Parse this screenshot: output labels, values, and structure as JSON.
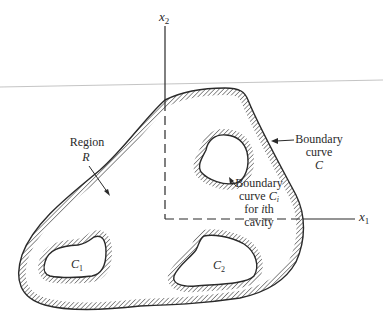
{
  "figure": {
    "axes": {
      "x1_label": "x",
      "x1_sub": "1",
      "x2_label": "x",
      "x2_sub": "2"
    },
    "labels": {
      "region_line1": "Region",
      "region_line2": "R",
      "boundary_c_line1": "Boundary",
      "boundary_c_line2": "curve",
      "boundary_c_line3": "C",
      "boundary_ci_line1": "Boundary",
      "boundary_ci_line2_prefix": "curve ",
      "boundary_ci_line2_var": "C",
      "boundary_ci_line2_sub": "i",
      "boundary_ci_line3_prefix": "for ",
      "boundary_ci_line3_var": "i",
      "boundary_ci_line3_suffix": "th",
      "boundary_ci_line4": "cavity",
      "cavity1_var": "C",
      "cavity1_sub": "1",
      "cavity2_var": "C",
      "cavity2_sub": "2"
    },
    "colors": {
      "ink": "#2a2a2a",
      "hatch": "#3a3a3a",
      "rule_line": "#b5b5b5",
      "background": "#ffffff"
    }
  }
}
